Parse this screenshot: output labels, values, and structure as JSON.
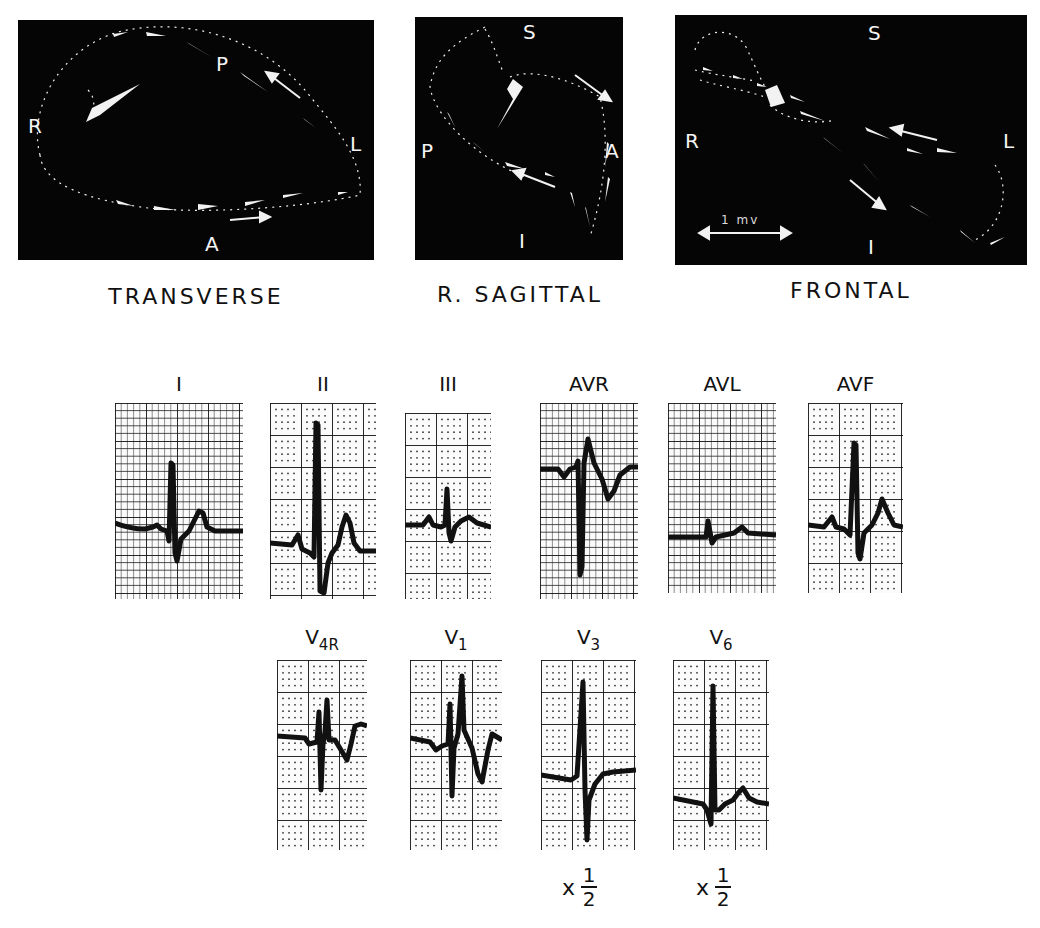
{
  "figure": {
    "vectorcardiograms": [
      {
        "id": "transverse",
        "title": "TRANSVERSE",
        "axes": {
          "top": "P",
          "bottom": "A",
          "left": "R",
          "right": "L"
        }
      },
      {
        "id": "r-sagittal",
        "title": "R. SAGITTAL",
        "axes": {
          "top": "S",
          "bottom": "I",
          "left": "P",
          "right": "A"
        }
      },
      {
        "id": "frontal",
        "title": "FRONTAL",
        "axes": {
          "top": "S",
          "bottom": "I",
          "left": "R",
          "right": "L"
        },
        "scale_bar": "1 mv"
      }
    ],
    "limb_leads": [
      {
        "label": "I",
        "grid": "lined"
      },
      {
        "label": "II",
        "grid": "dotted"
      },
      {
        "label": "III",
        "grid": "dotted"
      },
      {
        "label": "AVR",
        "grid": "lined"
      },
      {
        "label": "AVL",
        "grid": "lined"
      },
      {
        "label": "AVF",
        "grid": "dotted"
      }
    ],
    "precordial_leads": [
      {
        "label": "V",
        "subscript": "4R",
        "grid": "dotted"
      },
      {
        "label": "V",
        "subscript": "1",
        "grid": "dotted"
      },
      {
        "label": "V",
        "subscript": "3",
        "grid": "dotted",
        "scale_note": {
          "prefix": "x",
          "numerator": "1",
          "denominator": "2"
        }
      },
      {
        "label": "V",
        "subscript": "6",
        "grid": "dotted",
        "scale_note": {
          "prefix": "x",
          "numerator": "1",
          "denominator": "2"
        }
      }
    ]
  }
}
